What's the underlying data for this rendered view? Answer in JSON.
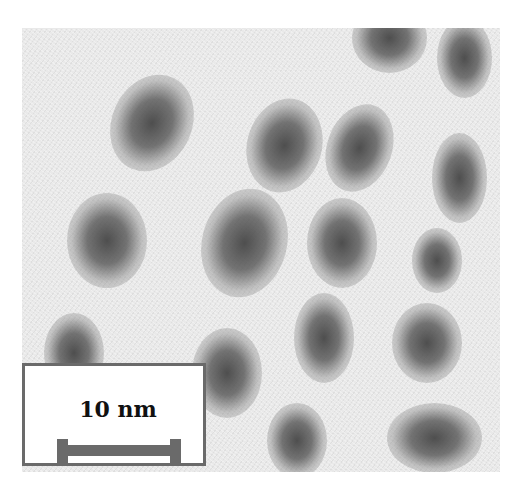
{
  "image": {
    "type": "transmission electron micrograph",
    "description": "Grayscale micrograph showing a lattice of dark elliptical blobs on a light noisy background"
  },
  "scale_bar": {
    "label": "10 nm",
    "color": "#6a6a6a"
  },
  "colors": {
    "background": "#e9e9e9",
    "blob": "#555555",
    "frame": "#6a6a6a"
  }
}
